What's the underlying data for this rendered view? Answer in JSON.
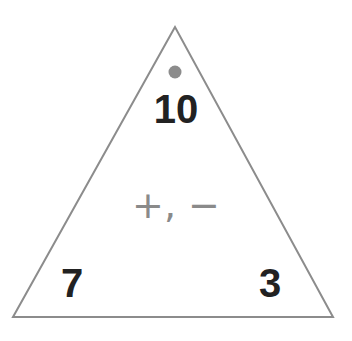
{
  "diagram": {
    "type": "fact-family-triangle",
    "top_number": "10",
    "bottom_left_number": "7",
    "bottom_right_number": "3",
    "operations": "+, −",
    "colors": {
      "outline": "#8c8c8c",
      "dot": "#8c8c8c",
      "numbers": "#222222",
      "operations": "#8a8a8a"
    }
  }
}
